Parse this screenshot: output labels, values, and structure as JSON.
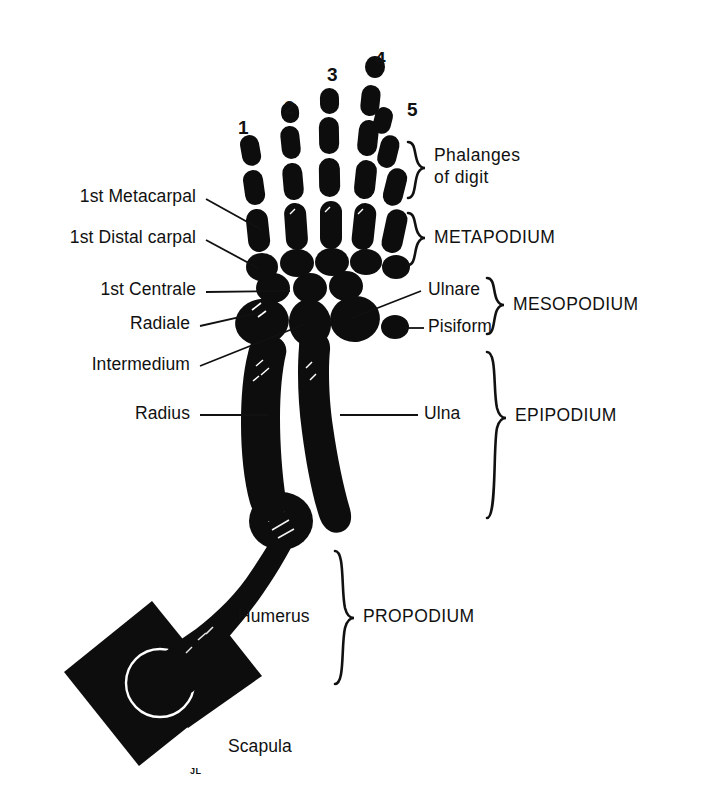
{
  "figure": {
    "ink_color": "#0d0d0d",
    "background_color": "#ffffff",
    "artist_initials": "JL"
  },
  "digits": {
    "numbers": [
      "1",
      "2",
      "3",
      "4",
      "5"
    ]
  },
  "bone_labels": {
    "metacarpal_1": "1st Metacarpal",
    "distal_carpal_1": "1st Distal carpal",
    "centrale_1": "1st Centrale",
    "radiale": "Radiale",
    "intermedium": "Intermedium",
    "radius": "Radius",
    "ulnare": "Ulnare",
    "pisiform": "Pisiform",
    "ulna": "Ulna",
    "humerus": "Humerus",
    "scapula": "Scapula"
  },
  "region_labels": {
    "phalanges_line1": "Phalanges",
    "phalanges_line2": "of digit",
    "metapodium": "METAPODIUM",
    "mesopodium": "MESOPODIUM",
    "epipodium": "EPIPODIUM",
    "propodium": "PROPODIUM"
  }
}
